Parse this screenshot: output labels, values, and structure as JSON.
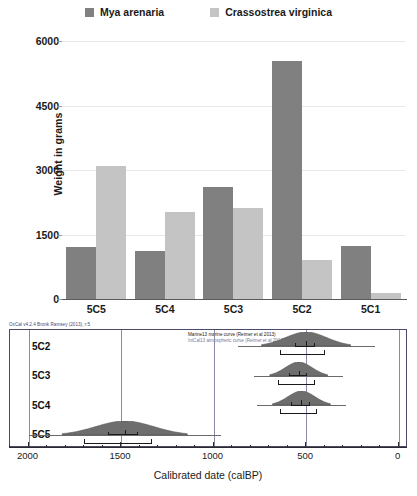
{
  "legend": {
    "items": [
      {
        "label": "Mya arenaria",
        "color": "#808080",
        "icon": "square-swatch-icon"
      },
      {
        "label": "Crassostrea virginica",
        "color": "#c4c4c4",
        "icon": "square-swatch-icon"
      }
    ]
  },
  "barchart": {
    "ylabel": "Weight in grams",
    "yticks": [
      "0",
      "1500",
      "3000",
      "4500",
      "6000"
    ]
  },
  "oxcal": {
    "credit": "OxCal v4.2.4 Bronk Ramsey (2013); r:5",
    "curve_marine": "Marine13 marine curve (Reimer et al 2013)",
    "curve_intcal": "IntCal13 atmospheric curve (Reimer et al 2013)",
    "rows": [
      {
        "label": "5C2"
      },
      {
        "label": "5C3"
      },
      {
        "label": "5C4"
      },
      {
        "label": "5C5"
      }
    ],
    "xticks": [
      "2000",
      "1500",
      "1000",
      "500",
      "0"
    ],
    "xtitle": "Calibrated date (calBP)"
  },
  "chart_data": [
    {
      "type": "bar",
      "title": "",
      "xlabel": "",
      "ylabel": "Weight in grams",
      "ylim": [
        0,
        6000
      ],
      "yticks": [
        0,
        1500,
        3000,
        4500,
        6000
      ],
      "grid": true,
      "legend_position": "top-center",
      "categories": [
        "5C5",
        "5C4",
        "5C3",
        "5C2",
        "5C1"
      ],
      "series": [
        {
          "name": "Mya arenaria",
          "color": "#808080",
          "values": [
            1200,
            1120,
            2600,
            5530,
            1230
          ]
        },
        {
          "name": "Crassostrea virginica",
          "color": "#c4c4c4",
          "values": [
            3100,
            2020,
            2120,
            900,
            150
          ]
        }
      ]
    },
    {
      "type": "area",
      "title": "OxCal calibrated radiocarbon ages",
      "xlabel": "Calibrated date (calBP)",
      "ylabel": "",
      "xlim": [
        2100,
        -40
      ],
      "xticks": [
        2000,
        1500,
        1000,
        500,
        0
      ],
      "x_reversed": true,
      "grid": false,
      "annotations": [
        "OxCal v4.2.4 Bronk Ramsey (2013); r:5",
        "Marine13 marine curve (Reimer et al 2013)",
        "IntCal13 atmospheric curve (Reimer et al 2013)"
      ],
      "series": [
        {
          "name": "5C2",
          "peak": 500,
          "range68": [
            560,
            450
          ],
          "range95": [
            640,
            400
          ],
          "spread": 185
        },
        {
          "name": "5C3",
          "peak": 540,
          "range68": [
            590,
            495
          ],
          "range95": [
            650,
            450
          ],
          "spread": 120
        },
        {
          "name": "5C4",
          "peak": 525,
          "range68": [
            580,
            480
          ],
          "range95": [
            640,
            440
          ],
          "spread": 120
        },
        {
          "name": "5C5",
          "peak": 1480,
          "range68": [
            1570,
            1410
          ],
          "range95": [
            1700,
            1330
          ],
          "spread": 260
        }
      ]
    }
  ]
}
